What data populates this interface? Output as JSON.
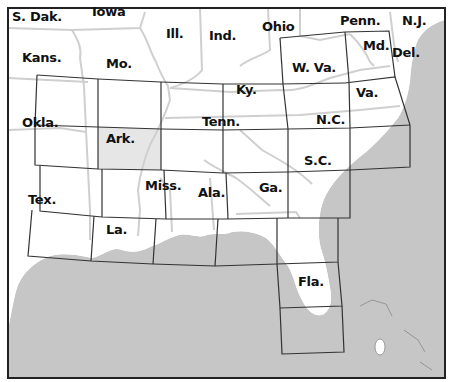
{
  "map": {
    "title": "Southeastern United States map index grid",
    "colors": {
      "land": "#ffffff",
      "water": "#c4c4c4",
      "state_border": "#cfcfcf",
      "grid_line": "#333333",
      "highlight_tile": "#e6e6e6",
      "frame": "#222222"
    },
    "highlighted_tile": "Ark.",
    "state_labels": [
      {
        "name": "S. Dak.",
        "x": 12,
        "y": 10
      },
      {
        "name": "Iowa",
        "x": 92,
        "y": 5
      },
      {
        "name": "Ill.",
        "x": 166,
        "y": 27
      },
      {
        "name": "Ind.",
        "x": 209,
        "y": 29
      },
      {
        "name": "Ohio",
        "x": 262,
        "y": 20
      },
      {
        "name": "Penn.",
        "x": 340,
        "y": 14
      },
      {
        "name": "N.J.",
        "x": 402,
        "y": 14
      },
      {
        "name": "Md.",
        "x": 363,
        "y": 39
      },
      {
        "name": "Del.",
        "x": 392,
        "y": 46
      },
      {
        "name": "Kans.",
        "x": 22,
        "y": 51
      },
      {
        "name": "Mo.",
        "x": 106,
        "y": 57
      },
      {
        "name": "W. Va.",
        "x": 292,
        "y": 61
      },
      {
        "name": "Ky.",
        "x": 236,
        "y": 83
      },
      {
        "name": "Va.",
        "x": 356,
        "y": 86
      },
      {
        "name": "Okla.",
        "x": 22,
        "y": 116
      },
      {
        "name": "Tenn.",
        "x": 202,
        "y": 115
      },
      {
        "name": "N.C.",
        "x": 316,
        "y": 113
      },
      {
        "name": "Ark.",
        "x": 106,
        "y": 132
      },
      {
        "name": "S.C.",
        "x": 304,
        "y": 154
      },
      {
        "name": "Miss.",
        "x": 145,
        "y": 179
      },
      {
        "name": "Ala.",
        "x": 198,
        "y": 186
      },
      {
        "name": "Ga.",
        "x": 259,
        "y": 181
      },
      {
        "name": "Tex.",
        "x": 28,
        "y": 193
      },
      {
        "name": "La.",
        "x": 106,
        "y": 223
      },
      {
        "name": "Fla.",
        "x": 298,
        "y": 275
      }
    ]
  }
}
